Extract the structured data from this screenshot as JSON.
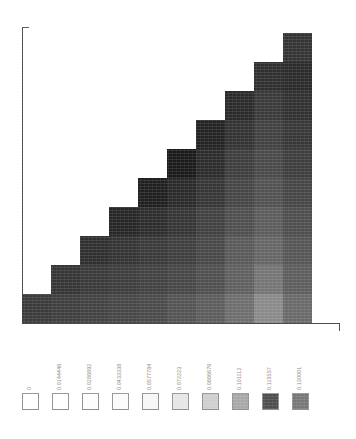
{
  "chart_data": {
    "type": "heatmap",
    "title": "",
    "subtitle": "",
    "xlabel": "",
    "ylabel": "",
    "grid": false,
    "legend_position": "bottom",
    "layout": "upper-triangular-staircase",
    "n_rows": 10,
    "n_cols": 10,
    "axis_ticks": {
      "x": [],
      "y": []
    },
    "colorbar": {
      "orientation": "horizontal",
      "n_swatches": 10,
      "min": 0,
      "max": 0.130001,
      "labels": [
        "0",
        "0.0144446",
        "0.0288892",
        "0.0433338",
        "0.0577784",
        "0.072223",
        "0.0866676",
        "0.101112",
        "0.115557",
        "0.130001"
      ],
      "values": [
        0,
        0.0144446,
        0.0288892,
        0.0433338,
        0.0577784,
        0.072223,
        0.0866676,
        0.101112,
        0.115557,
        0.130001
      ],
      "swatch_colors": [
        "#ffffff",
        "#ffffff",
        "#fdfdfd",
        "#fbfbfb",
        "#f7f7f7",
        "#e6e6e6",
        "#cfcfcf",
        "#a8a8a8",
        "#4d4d4d",
        "#777777"
      ]
    },
    "colors": {
      "axis": "#4a4a4a",
      "label": "#8d8d8d",
      "swatch_border": "#8f8f8f",
      "background": "#ffffff"
    },
    "cell_values": [
      [
        0.118,
        0.112,
        0.101,
        0.093,
        0.084,
        0.072,
        0.061,
        0.047,
        0.03,
        0.041
      ],
      [
        null,
        0.121,
        0.115,
        0.104,
        0.096,
        0.087,
        0.074,
        0.058,
        0.043,
        0.052
      ],
      [
        null,
        null,
        0.124,
        0.117,
        0.107,
        0.098,
        0.083,
        0.066,
        0.052,
        0.06
      ],
      [
        null,
        null,
        null,
        0.127,
        0.12,
        0.11,
        0.094,
        0.077,
        0.062,
        0.069
      ],
      [
        null,
        null,
        null,
        null,
        0.129,
        0.122,
        0.106,
        0.088,
        0.072,
        0.079
      ],
      [
        null,
        null,
        null,
        null,
        null,
        0.13,
        0.119,
        0.1,
        0.084,
        0.09
      ],
      [
        null,
        null,
        null,
        null,
        null,
        null,
        0.126,
        0.113,
        0.096,
        0.101
      ],
      [
        null,
        null,
        null,
        null,
        null,
        null,
        null,
        0.122,
        0.108,
        0.112
      ],
      [
        null,
        null,
        null,
        null,
        null,
        null,
        null,
        null,
        0.117,
        0.121
      ],
      [
        null,
        null,
        null,
        null,
        null,
        null,
        null,
        null,
        null,
        0.113
      ]
    ],
    "cell_shades": [
      [
        "#3b3b3b",
        "#3f3f3f",
        "#434343",
        "#474747",
        "#4b4b4b",
        "#545454",
        "#5d5d5d",
        "#6e6e6e",
        "#8a8a8a",
        "#6a6a6a"
      ],
      [
        null,
        "#353535",
        "#3a3a3a",
        "#3e3e3e",
        "#424242",
        "#474747",
        "#505050",
        "#606060",
        "#757575",
        "#5e5e5e"
      ],
      [
        null,
        null,
        "#2f2f2f",
        "#343434",
        "#3a3a3a",
        "#3f3f3f",
        "#484848",
        "#5a5a5a",
        "#666666",
        "#565656"
      ],
      [
        null,
        null,
        null,
        "#262626",
        "#2d2d2d",
        "#353535",
        "#414141",
        "#4f4f4f",
        "#5c5c5c",
        "#4e4e4e"
      ],
      [
        null,
        null,
        null,
        null,
        "#1f1f1f",
        "#2a2a2a",
        "#363636",
        "#464646",
        "#525252",
        "#464646"
      ],
      [
        null,
        null,
        null,
        null,
        null,
        "#1a1a1a",
        "#2c2c2c",
        "#3e3e3e",
        "#4a4a4a",
        "#3e3e3e"
      ],
      [
        null,
        null,
        null,
        null,
        null,
        null,
        "#232323",
        "#333333",
        "#414141",
        "#373737"
      ],
      [
        null,
        null,
        null,
        null,
        null,
        null,
        null,
        "#2a2a2a",
        "#3a3a3a",
        "#313131"
      ],
      [
        null,
        null,
        null,
        null,
        null,
        null,
        null,
        null,
        "#2f2f2f",
        "#2b2b2b"
      ],
      [
        null,
        null,
        null,
        null,
        null,
        null,
        null,
        null,
        null,
        "#343434"
      ]
    ]
  },
  "figure": {
    "plot": {
      "left": 22,
      "top": 27,
      "width": 318,
      "height": 296,
      "cell_w": 29.0,
      "cell_h": 29.0,
      "origin_col": 1,
      "origin_row": 0
    },
    "legend": {
      "first_x": 22,
      "pitch": 30.0,
      "swatch_size": 17
    }
  }
}
